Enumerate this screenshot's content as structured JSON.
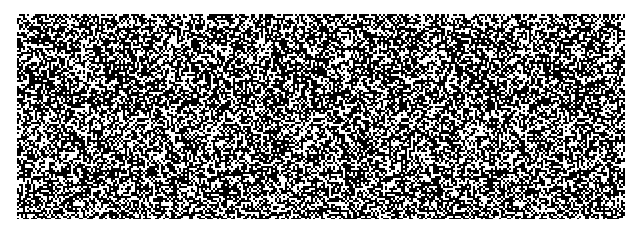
{
  "image": {
    "type": "random-dot autostereogram",
    "width": 641,
    "height": 233,
    "border_color": "#ffffff",
    "pattern": {
      "x": 17,
      "y": 14,
      "width": 608,
      "height": 205,
      "foreground": "#ffffff",
      "background": "#000000",
      "density": 0.42,
      "repeat_period": 88,
      "seed": 7
    }
  }
}
